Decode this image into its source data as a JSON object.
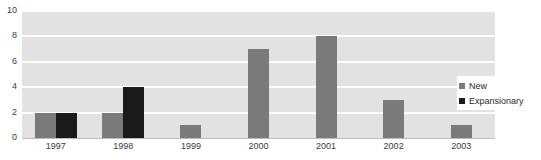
{
  "chart_data": {
    "type": "bar",
    "title": "",
    "subtitle": "",
    "xlabel": "",
    "ylabel": "",
    "categories": [
      "1997",
      "1998",
      "1999",
      "2000",
      "2001",
      "2002",
      "2003"
    ],
    "series": [
      {
        "name": "New",
        "color": "#7a7a7a",
        "values": [
          2,
          2,
          1,
          7,
          8,
          3,
          1
        ]
      },
      {
        "name": "Expansionary",
        "color": "#1a1a1a",
        "values": [
          2,
          4,
          0,
          0,
          0,
          0,
          0
        ]
      }
    ],
    "ylim": [
      0,
      10
    ],
    "ytick_values": [
      "10",
      "8",
      "6",
      "4",
      "2",
      "0"
    ],
    "ytick_step": 2,
    "grid": true,
    "grid_color": "#ffffff",
    "plot_background": "#e2e2e2",
    "legend_position": "right",
    "annotations": []
  },
  "axes": {
    "y_ticks": [
      "10",
      "8",
      "6",
      "4",
      "2",
      "0"
    ],
    "x_ticks": [
      "1997",
      "1998",
      "1999",
      "2000",
      "2001",
      "2002",
      "2003"
    ]
  },
  "legend": {
    "entries": [
      {
        "label": "New",
        "color": "#7a7a7a"
      },
      {
        "label": "Expansionary",
        "color": "#1a1a1a"
      }
    ]
  },
  "cutoff_text": "·  ·  ·       ·     ·                        ·          ·"
}
